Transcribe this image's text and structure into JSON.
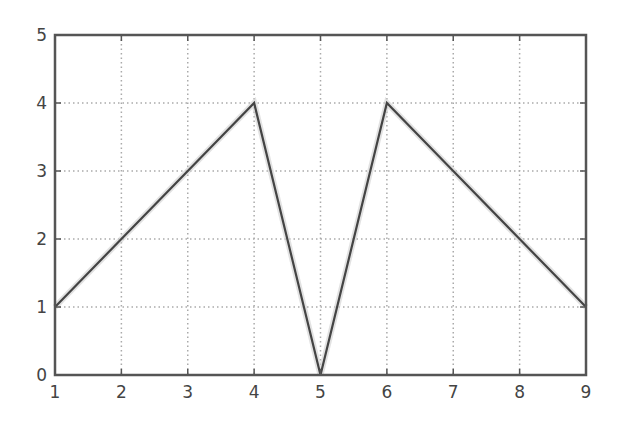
{
  "chart_data": {
    "type": "line",
    "title": "",
    "xlabel": "",
    "ylabel": "",
    "x": [
      1,
      2,
      3,
      4,
      5,
      6,
      7,
      8,
      9
    ],
    "series": [
      {
        "name": "series-1",
        "values": [
          1,
          2,
          3,
          4,
          0,
          4,
          3,
          2,
          1
        ],
        "color": "#444444"
      }
    ],
    "xlim": [
      1,
      9
    ],
    "ylim": [
      0,
      5
    ],
    "xticks": [
      "1",
      "2",
      "3",
      "4",
      "5",
      "6",
      "7",
      "8",
      "9"
    ],
    "yticks": [
      "0",
      "1",
      "2",
      "3",
      "4",
      "5"
    ],
    "grid": true,
    "grid_style": "dotted",
    "legend": null
  },
  "colors": {
    "axis": "#555555",
    "grid": "#aaaaaa",
    "line": "#444444",
    "tick_label": "#444444"
  }
}
